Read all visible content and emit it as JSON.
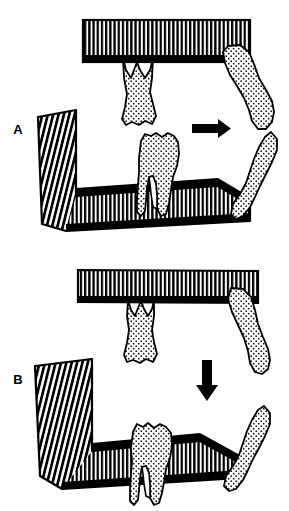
{
  "figure": {
    "background_color": "#ffffff",
    "ink_color": "#000000",
    "width": 289,
    "height": 511
  },
  "panels": [
    {
      "id": "A",
      "label": "A",
      "label_x": 18,
      "label_y": 130,
      "arrow": {
        "name": "horizontal-drift-arrow",
        "direction": "right",
        "x": 192,
        "y": 128,
        "length": 38
      },
      "maxilla": {
        "name": "maxilla-bone-bar",
        "hatch": "vertical-lines",
        "x": 83,
        "y": 20,
        "width": 167,
        "height": 42
      },
      "mandible": {
        "name": "mandible-bone",
        "hatch": "vertical-and-diagonal-lines"
      },
      "teeth": [
        {
          "name": "upper-premolar",
          "position": "upper-left",
          "orientation": "vertical",
          "fill": "stipple"
        },
        {
          "name": "upper-molar-tipped",
          "position": "upper-right",
          "orientation": "tipped-mesially",
          "fill": "stipple"
        },
        {
          "name": "lower-molar",
          "position": "lower-left",
          "orientation": "vertical",
          "fill": "stipple"
        },
        {
          "name": "lower-molar-tipped",
          "position": "lower-right",
          "orientation": "tipped-mesially",
          "fill": "stipple"
        }
      ]
    },
    {
      "id": "B",
      "label": "B",
      "label_x": 18,
      "label_y": 380,
      "arrow": {
        "name": "vertical-overeruption-arrow",
        "direction": "down",
        "x": 207,
        "y": 360,
        "length": 40
      },
      "maxilla": {
        "name": "maxilla-bone-bar",
        "hatch": "vertical-lines",
        "x": 78,
        "y": 270,
        "width": 180,
        "height": 33
      },
      "mandible": {
        "name": "mandible-bone",
        "hatch": "vertical-and-diagonal-lines"
      },
      "teeth": [
        {
          "name": "upper-premolar",
          "position": "upper-left",
          "orientation": "vertical",
          "fill": "stipple"
        },
        {
          "name": "upper-molar-tipped",
          "position": "upper-right",
          "orientation": "tipped-mesially",
          "fill": "stipple"
        },
        {
          "name": "lower-molar",
          "position": "lower-left",
          "orientation": "vertical",
          "fill": "stipple"
        },
        {
          "name": "lower-molar-tipped",
          "position": "lower-right",
          "orientation": "tipped-mesially",
          "fill": "stipple"
        }
      ]
    }
  ]
}
